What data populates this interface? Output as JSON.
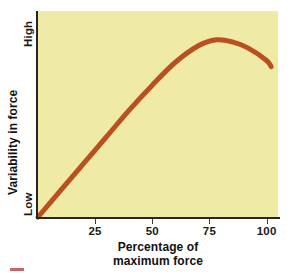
{
  "figure": {
    "background_color": "#ffffff",
    "plot_background_color": "#efeaa6",
    "axis_color": "#262626",
    "curve_color": "#b8501f"
  },
  "axes": {
    "y": {
      "title": "Variability in force",
      "low_label": "Low",
      "high_label": "High"
    },
    "x": {
      "title_line1": "Percentage of",
      "title_line2": "maximum force",
      "ticks": [
        {
          "value": 25,
          "label": "25"
        },
        {
          "value": 50,
          "label": "50"
        },
        {
          "value": 75,
          "label": "75"
        },
        {
          "value": 100,
          "label": "100"
        }
      ]
    }
  },
  "caption_marker": {
    "color": "#b0343a"
  },
  "chart_data": {
    "type": "line",
    "title": "",
    "subtitle": "",
    "xlabel": "Percentage of maximum force",
    "ylabel": "Variability in force",
    "xlim": [
      0,
      105
    ],
    "ylim": [
      0,
      100
    ],
    "grid": false,
    "legend": null,
    "x_tick_labels": [
      "25",
      "50",
      "75",
      "100"
    ],
    "x_tick_values": [
      25,
      50,
      75,
      100
    ],
    "y_tick_labels": [
      "Low",
      "High"
    ],
    "y_tick_values": [
      0,
      100
    ],
    "series": [
      {
        "name": "Variability in force",
        "color": "#b8501f",
        "line_width": 5,
        "x": [
          0,
          10,
          20,
          30,
          40,
          50,
          60,
          70,
          78,
          85,
          92,
          100,
          102
        ],
        "values": [
          0,
          13,
          26,
          39,
          52,
          64,
          75,
          83,
          86,
          85,
          82,
          76,
          73
        ]
      }
    ],
    "annotations": [
      "Curve rises steeply and nearly linearly from Low at 0% to about 60% of maximum force",
      "Curve flattens and peaks near 78% of maximum force",
      "Curve declines gradually from the peak toward 100% of maximum force"
    ]
  }
}
